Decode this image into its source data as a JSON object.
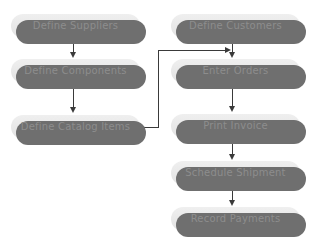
{
  "diagram": {
    "background_color": "#ffffff",
    "node_fill_color": "#e9e9e9",
    "node_shadow_color": "#6f6f6f",
    "node_text_color": "#8d8d8d",
    "connector_color": "#3a3a3a",
    "left_column": [
      {
        "id": "define-suppliers",
        "label": "Define Suppliers",
        "x": 11,
        "y": 14,
        "width": 129
      },
      {
        "id": "define-components",
        "label": "Define Components",
        "x": 11,
        "y": 59,
        "width": 129
      },
      {
        "id": "define-catalog-items",
        "label": "Define Catalog Items",
        "x": 11,
        "y": 115,
        "width": 129
      }
    ],
    "right_column": [
      {
        "id": "define-customers",
        "label": "Define Customers",
        "x": 171,
        "y": 14,
        "width": 129
      },
      {
        "id": "enter-orders",
        "label": "Enter Orders",
        "x": 171,
        "y": 59,
        "width": 129
      },
      {
        "id": "print-invoice",
        "label": "Print Invoice",
        "x": 171,
        "y": 114,
        "width": 129
      },
      {
        "id": "schedule-shipment",
        "label": "Schedule Shipment",
        "x": 171,
        "y": 161,
        "width": 129
      },
      {
        "id": "record-payments",
        "label": "Record Payments",
        "x": 171,
        "y": 207,
        "width": 129
      }
    ],
    "connectors": [
      {
        "id": "suppliers-to-components",
        "from": "define-suppliers",
        "to": "define-components",
        "type": "vertical-arrow"
      },
      {
        "id": "components-to-catalog",
        "from": "define-components",
        "to": "define-catalog-items",
        "type": "vertical-arrow"
      },
      {
        "id": "catalog-to-orders",
        "from": "define-catalog-items",
        "to": "enter-orders",
        "type": "elbow-arrow"
      },
      {
        "id": "customers-to-orders",
        "from": "define-customers",
        "to": "enter-orders",
        "type": "vertical-arrow"
      },
      {
        "id": "orders-to-invoice",
        "from": "enter-orders",
        "to": "print-invoice",
        "type": "vertical-arrow"
      },
      {
        "id": "invoice-to-shipment",
        "from": "print-invoice",
        "to": "schedule-shipment",
        "type": "vertical-arrow"
      },
      {
        "id": "shipment-to-payments",
        "from": "schedule-shipment",
        "to": "record-payments",
        "type": "vertical-arrow"
      }
    ]
  }
}
